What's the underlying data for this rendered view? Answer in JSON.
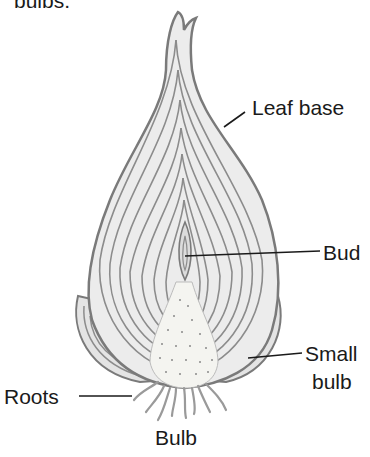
{
  "caption": "bulbs.",
  "title": "Bulb",
  "labels": {
    "leaf_base": "Leaf base",
    "bud": "Bud",
    "small_bulb_line1": "Small",
    "small_bulb_line2": "bulb",
    "roots": "Roots"
  },
  "colors": {
    "outline": "#7a7a7a",
    "fill": "#ececec",
    "ring": "#8c8c8c",
    "leader": "#1a1a1a",
    "text": "#1a1a1a"
  }
}
